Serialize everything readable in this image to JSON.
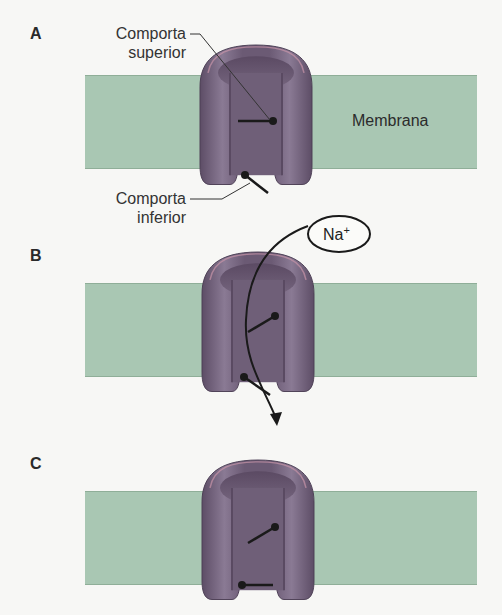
{
  "panels": [
    {
      "letter": "A",
      "state": "closed-inactivation-open"
    },
    {
      "letter": "B",
      "state": "open"
    },
    {
      "letter": "C",
      "state": "inactivated"
    }
  ],
  "labels": {
    "upper_gate_line1": "Comporta",
    "upper_gate_line2": "superior",
    "lower_gate_line1": "Comporta",
    "lower_gate_line2": "inferior",
    "membrane": "Membrana",
    "ion": "Na",
    "ion_charge": "+"
  },
  "colors": {
    "membrane": "#a9c7b3",
    "channel": "#7a6a82",
    "channel_dark": "#5e4f66",
    "background": "#f7f7f5"
  }
}
